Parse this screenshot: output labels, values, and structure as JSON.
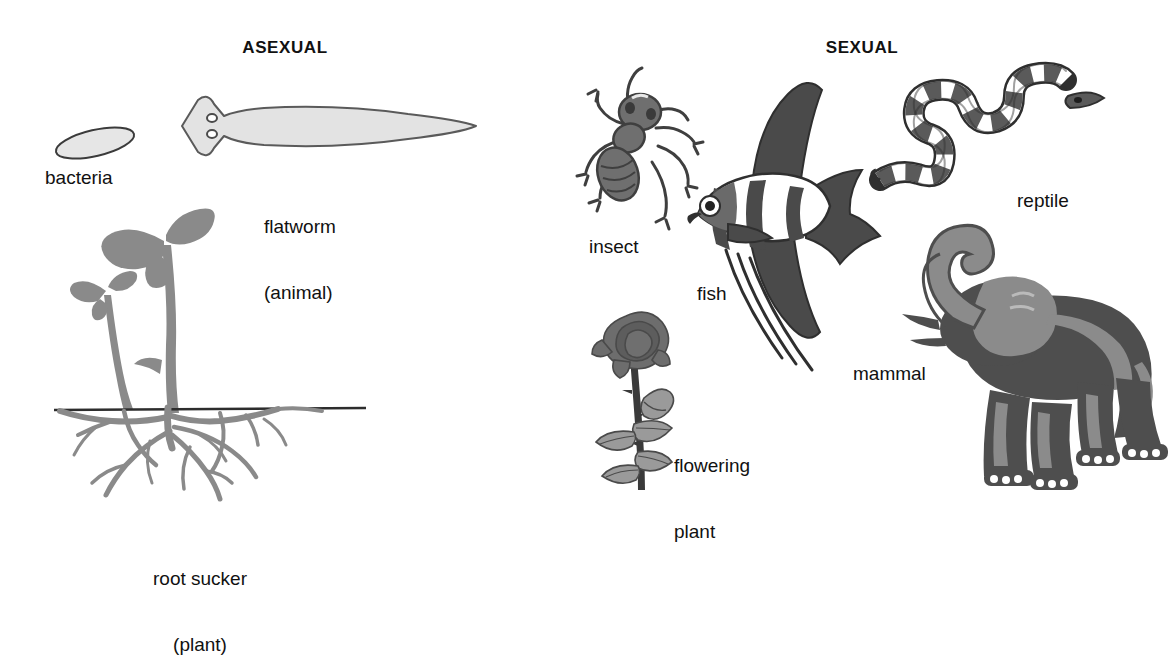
{
  "page": {
    "width": 1172,
    "height": 605,
    "background": "#ffffff",
    "topic": "Asexual and sexual reproduction examples"
  },
  "colors": {
    "ink": "#111111",
    "outline": "#3b3b3b",
    "pale_fill": "#e3e3e3",
    "mid_gray": "#8d8d8d",
    "dark_gray": "#5a5a5a",
    "deep_gray": "#4a4a4a",
    "plant_gray": "#8a8a8a",
    "elephant_dark": "#4e4e4e",
    "elephant_light": "#8b8b8b",
    "white": "#ffffff"
  },
  "columns": {
    "asexual": {
      "heading": "ASEXUAL",
      "heading_x": 285,
      "heading_y": 46,
      "items": [
        {
          "key": "bacteria",
          "label": "bacteria",
          "label_lines": [
            "bacteria"
          ],
          "label_x": 45,
          "label_y": 178,
          "align": "left"
        },
        {
          "key": "flatworm",
          "label": "flatworm",
          "label_lines": [
            "flatworm",
            "(animal)"
          ],
          "label_x": 264,
          "label_y": 182,
          "align": "left"
        },
        {
          "key": "root-sucker",
          "label": "root sucker",
          "label_lines": [
            "root sucker",
            "(plant)"
          ],
          "label_x": 200,
          "label_y": 533,
          "align": "center"
        }
      ]
    },
    "sexual": {
      "heading": "SEXUAL",
      "heading_x": 862,
      "heading_y": 46,
      "items": [
        {
          "key": "insect",
          "label": "insect",
          "label_lines": [
            "insect"
          ],
          "label_x": 589,
          "label_y": 246,
          "align": "left"
        },
        {
          "key": "fish",
          "label": "fish",
          "label_lines": [
            "fish"
          ],
          "label_x": 697,
          "label_y": 293,
          "align": "left"
        },
        {
          "key": "flowering-plant",
          "label": "flowering plant",
          "label_lines": [
            "flowering",
            "plant"
          ],
          "label_x": 674,
          "label_y": 421,
          "align": "left"
        },
        {
          "key": "reptile",
          "label": "reptile",
          "label_lines": [
            "reptile"
          ],
          "label_x": 1017,
          "label_y": 200,
          "align": "left"
        },
        {
          "key": "mammal",
          "label": "mammal",
          "label_lines": [
            "mammal"
          ],
          "label_x": 853,
          "label_y": 373,
          "align": "left"
        }
      ]
    }
  },
  "figures": {
    "bacteria": "single pale ellipse, tilted, dark outline",
    "flatworm": "planarian with arrow-shaped head and two eyespots, pale gray body",
    "root_sucker": "parent shoot with leaves plus smaller sucker shoot rising from spreading root mass, ground line",
    "insect": "ant in dorsal view with banded abdomen, two antennae and six jointed legs",
    "fish": "angelfish with tall dark dorsal and anal fins, white body with dark vertical bars, long trailing pelvic filaments",
    "flowering_plant": "rose bloom on thorny stem with leaves and a bud",
    "reptile": "banded snake in S-curve with alternating dark and white bands",
    "mammal": "elephant standing with raised curled trunk, tusks, large ear and white toenails"
  }
}
